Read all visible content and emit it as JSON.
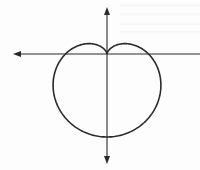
{
  "figure": {
    "type": "polar-curve",
    "curve": "cardioid",
    "equation": "r = a(1 - sin θ)",
    "colors": {
      "background": "#fdfdfd",
      "stroke": "#2a2a2a"
    },
    "origin_px": [
      107,
      54
    ],
    "a_px": 41.5,
    "axes": {
      "x_axis": {
        "from_px": 13,
        "to_px": 200,
        "y_px": 54,
        "arrowhead": "left"
      },
      "y_axis": {
        "from_px": 7,
        "to_px": 164,
        "x_px": 107,
        "arrowheads": [
          "top",
          "bottom"
        ]
      }
    }
  }
}
